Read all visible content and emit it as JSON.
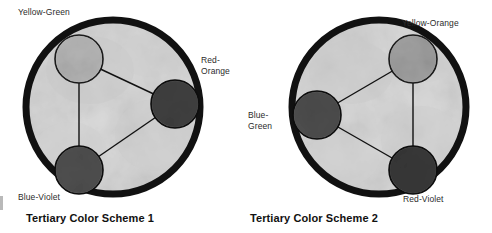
{
  "figures": [
    {
      "id": "tertiary-color-scheme-1",
      "caption": "Tertiary Color Scheme 1",
      "wheel": {
        "center_x": 113,
        "center_y": 107,
        "radius": 91,
        "rim_color": "#111111",
        "rim_width": 7,
        "face_color": "#d9d9d9"
      },
      "swatches": [
        {
          "name": "Yellow-Green",
          "label": "Yellow-Green",
          "label_lines": [
            "Yellow-Green"
          ],
          "cx": 79,
          "cy": 59,
          "r": 24,
          "color": "#b4b4b4",
          "outline": "#1a1a1a"
        },
        {
          "name": "Red-Orange",
          "label": "Red-Orange",
          "label_lines": [
            "Red-",
            "Orange"
          ],
          "cx": 175,
          "cy": 104,
          "r": 24,
          "color": "#3a3a3a",
          "outline": "#0d0d0d"
        },
        {
          "name": "Blue-Violet",
          "label": "Blue-Violet",
          "label_lines": [
            "Blue-Violet"
          ],
          "cx": 79,
          "cy": 170,
          "r": 24,
          "color": "#4b4b4b",
          "outline": "#0d0d0d"
        }
      ],
      "connections": [
        [
          "Yellow-Green",
          "Red-Orange"
        ],
        [
          "Red-Orange",
          "Blue-Violet"
        ],
        [
          "Blue-Violet",
          "Yellow-Green"
        ]
      ],
      "connector_color": "#111111"
    },
    {
      "id": "tertiary-color-scheme-2",
      "caption": "Tertiary Color Scheme 2",
      "wheel": {
        "center_x": 133,
        "center_y": 107,
        "radius": 91,
        "rim_color": "#111111",
        "rim_width": 7,
        "face_color": "#d9d9d9"
      },
      "swatches": [
        {
          "name": "Yellow-Orange",
          "label": "Yellow-Orange",
          "label_lines": [
            "Yellow-Orange"
          ],
          "cx": 167,
          "cy": 59,
          "r": 24,
          "color": "#9d9d9d",
          "outline": "#1a1a1a"
        },
        {
          "name": "Blue-Green",
          "label": "Blue-Green",
          "label_lines": [
            "Blue-",
            "Green"
          ],
          "cx": 71,
          "cy": 115,
          "r": 24,
          "color": "#4a4a4a",
          "outline": "#0d0d0d"
        },
        {
          "name": "Red-Violet",
          "label": "Red-Violet",
          "label_lines": [
            "Red-Violet"
          ],
          "cx": 167,
          "cy": 170,
          "r": 24,
          "color": "#333333",
          "outline": "#0d0d0d"
        }
      ],
      "connections": [
        [
          "Yellow-Orange",
          "Blue-Green"
        ],
        [
          "Blue-Green",
          "Red-Violet"
        ],
        [
          "Red-Violet",
          "Yellow-Orange"
        ]
      ],
      "connector_color": "#111111"
    }
  ]
}
